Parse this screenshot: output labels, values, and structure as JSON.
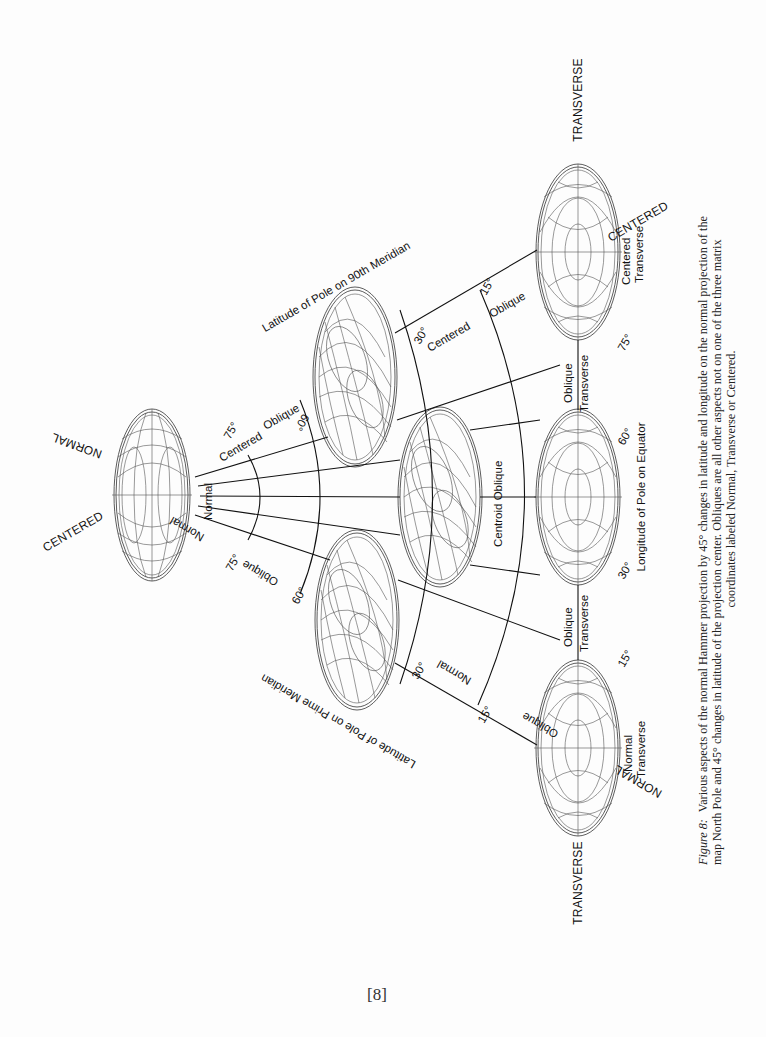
{
  "figure": {
    "number_label": "Figure 8:",
    "caption_line1": "Various aspects of the normal Hammer projection by 45° changes in latitude and longitude on the normal projection of the",
    "caption_line2": "map North Pole and 45° changes in latitude of the projection center. Obliques are all other aspects not on one of the three matrix",
    "caption_line3": "coordinates labeled Normal, Transverse or Centered."
  },
  "axes": {
    "lat_90th": "Latitude of Pole on 90th Meridian",
    "lat_prime": "Latitude of Pole on Prime Meridian",
    "lon_equator": "Longitude of Pole on Equator"
  },
  "corner_labels": {
    "normal_top": "NORMAL",
    "centered_top": "CENTERED",
    "transverse_right_top": "TRANSVERSE",
    "centered_right": "CENTERED",
    "transverse_bottom": "TRANSVERSE",
    "normal_bottom": "NORMAL"
  },
  "arc_labels": {
    "centered_75": "Centered",
    "deg_75_top": "75°",
    "normal_mid": "Normal",
    "normal_75": "Normal",
    "deg_75_bottom": "75°",
    "oblique_60_top": "Oblique",
    "deg_60_top": "60°",
    "oblique_60_bottom": "Oblique",
    "deg_60_bottom": "60°",
    "centered_30": "Centered",
    "deg_30_top": "30°",
    "normal_30": "Normal",
    "deg_30_bottom": "30°",
    "oblique_15_top": "Oblique",
    "deg_15_top": "15°",
    "oblique_15_bottom": "Oblique",
    "deg_15_bottom": "15°",
    "centroid_oblique": "Centroid Oblique"
  },
  "right_labels": {
    "centered_transverse_1": "Centered",
    "centered_transverse_2": "Transverse",
    "deg_75": "75°",
    "oblique_upper": "Oblique",
    "transverse_upper": "Transverse",
    "deg_60": "60°",
    "deg_30": "30°",
    "oblique_lower": "Oblique",
    "transverse_lower": "Transverse",
    "deg_15": "15°",
    "normal_transverse_1": "Normal",
    "normal_transverse_2": "Transverse"
  },
  "page": {
    "number": "[8]"
  }
}
